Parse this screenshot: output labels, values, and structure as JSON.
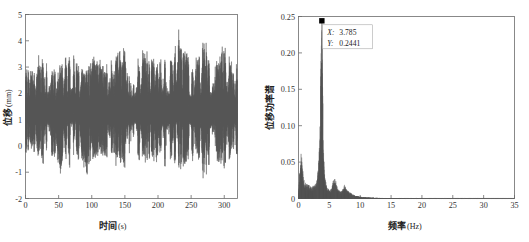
{
  "figure": {
    "background": "#ffffff",
    "trace_color": "#555555",
    "axis_color": "#6b6b6b",
    "marker_color": "#000000"
  },
  "chart_data": [
    {
      "id": "displacement-time-history",
      "type": "line",
      "title": "",
      "xlabel_cjk": "时间",
      "xlabel_unit": "(s)",
      "ylabel_cjk": "位移",
      "ylabel_unit": "(mm)",
      "xlim": [
        0,
        320
      ],
      "ylim": [
        -2,
        5
      ],
      "xticks": [
        0,
        50,
        100,
        150,
        200,
        250,
        300
      ],
      "xtick_labels": [
        "0",
        "50",
        "100",
        "150",
        "200",
        "250",
        "300"
      ],
      "yticks": [
        -2,
        -1,
        0,
        1,
        2,
        3,
        4,
        5
      ],
      "ytick_labels": [
        "-2",
        "-1",
        "0",
        "1",
        "2",
        "3",
        "4",
        "5"
      ],
      "grid": false,
      "legend": "none",
      "series": [
        {
          "name": "displacement",
          "color": "#555555",
          "description": "dense narrow-band random vibration, dominant frequency 3.785 Hz, mean offset about 1.30 mm",
          "mean": 1.3,
          "rms_amplitude": 0.78,
          "dominant_frequency_hz": 3.785,
          "observed_max": 4.3,
          "observed_min": -1.25,
          "envelope_samples": {
            "t": [
              0,
              10,
              20,
              30,
              40,
              50,
              60,
              70,
              80,
              90,
              100,
              110,
              120,
              130,
              140,
              150,
              160,
              170,
              180,
              190,
              200,
              210,
              220,
              230,
              240,
              250,
              260,
              270,
              280,
              290,
              300,
              310,
              320
            ],
            "upper": [
              2.9,
              2.7,
              3.2,
              3.3,
              2.9,
              3.0,
              3.2,
              3.6,
              3.1,
              2.8,
              3.4,
              3.1,
              3.0,
              3.5,
              3.4,
              3.7,
              3.0,
              3.2,
              3.6,
              3.3,
              3.1,
              3.5,
              3.2,
              4.3,
              3.5,
              3.1,
              3.3,
              4.0,
              3.4,
              3.2,
              3.6,
              3.3,
              3.0
            ],
            "lower": [
              -0.2,
              -0.1,
              -0.4,
              -0.5,
              -0.2,
              -1.1,
              -0.4,
              -0.6,
              -0.3,
              -0.9,
              -0.5,
              -0.3,
              -0.4,
              -0.7,
              -0.5,
              -0.8,
              -0.3,
              -0.4,
              -0.6,
              -0.5,
              -0.4,
              -0.7,
              -0.5,
              -0.9,
              -0.6,
              -0.4,
              -0.5,
              -1.2,
              -0.6,
              -0.4,
              -0.8,
              -0.5,
              -0.3
            ]
          }
        }
      ]
    },
    {
      "id": "displacement-power-spectrum",
      "type": "line",
      "title": "",
      "xlabel_cjk": "频率",
      "xlabel_unit": "(Hz)",
      "ylabel_cjk": "位移功率谱",
      "ylabel_unit": "",
      "xlim": [
        0,
        35
      ],
      "ylim": [
        0,
        0.25
      ],
      "xticks": [
        0,
        5,
        10,
        15,
        20,
        25,
        30,
        35
      ],
      "xtick_labels": [
        "0",
        "5",
        "10",
        "15",
        "20",
        "25",
        "30",
        "35"
      ],
      "yticks": [
        0,
        0.05,
        0.1,
        0.15,
        0.2,
        0.25
      ],
      "ytick_labels": [
        "0",
        "0.05",
        "0.10",
        "0.15",
        "0.20",
        "0.25"
      ],
      "grid": false,
      "legend": "none",
      "peak_marker": {
        "x": 3.785,
        "y": 0.2441,
        "shape": "square",
        "color": "#000000"
      },
      "annotation": {
        "x_key": "X:",
        "x_value": "3.785",
        "y_key": "Y:",
        "y_value": "0.2441"
      },
      "series": [
        {
          "name": "power-spectrum",
          "color": "#555555",
          "x": [
            0.0,
            0.2,
            0.4,
            0.6,
            0.8,
            1.0,
            1.2,
            1.4,
            1.6,
            1.8,
            2.0,
            2.2,
            2.4,
            2.6,
            2.8,
            3.0,
            3.2,
            3.4,
            3.6,
            3.785,
            3.9,
            4.1,
            4.3,
            4.6,
            5.0,
            5.4,
            5.8,
            6.0,
            6.3,
            6.7,
            7.1,
            7.5,
            7.9,
            8.3,
            8.7,
            9.2,
            9.8,
            10.5,
            11.5,
            12.5,
            13.5,
            15.0,
            17.0,
            20.0,
            25.0,
            30.0,
            35.0
          ],
          "y": [
            0.004,
            0.04,
            0.07,
            0.05,
            0.03,
            0.024,
            0.021,
            0.02,
            0.019,
            0.018,
            0.018,
            0.017,
            0.018,
            0.019,
            0.022,
            0.028,
            0.04,
            0.075,
            0.16,
            0.2441,
            0.15,
            0.06,
            0.028,
            0.016,
            0.012,
            0.014,
            0.035,
            0.028,
            0.014,
            0.01,
            0.012,
            0.02,
            0.012,
            0.009,
            0.006,
            0.004,
            0.003,
            0.002,
            0.0015,
            0.001,
            0.0008,
            0.0006,
            0.0004,
            0.0003,
            0.0002,
            0.0002,
            0.0001
          ]
        }
      ]
    }
  ]
}
